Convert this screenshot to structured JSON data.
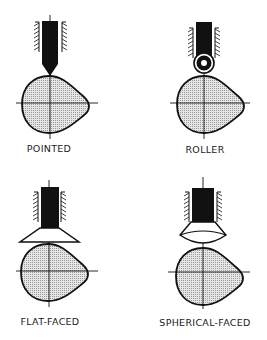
{
  "diagram": {
    "panels": [
      {
        "id": "pointed",
        "label": "POINTED",
        "follower": "pointed"
      },
      {
        "id": "roller",
        "label": "ROLLER",
        "follower": "roller"
      },
      {
        "id": "flat-faced",
        "label": "FLAT-FACED",
        "follower": "flat-faced"
      },
      {
        "id": "spherical-faced",
        "label": "SPHERICAL-FACED",
        "follower": "spherical-faced"
      }
    ],
    "colors": {
      "ink": "#111111",
      "cam_fill": "#d9d9d9",
      "background": "#ffffff"
    }
  }
}
